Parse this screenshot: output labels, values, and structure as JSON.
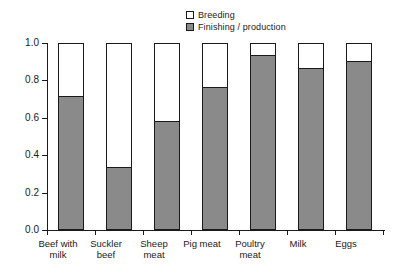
{
  "chart_data": {
    "type": "bar",
    "subtype": "stacked-bar-100percent",
    "title": "",
    "xlabel": "",
    "ylabel": "",
    "ylim": [
      0.0,
      1.0
    ],
    "grid": false,
    "legend_position": "top-center",
    "categories": [
      "Beef with milk",
      "Suckler beef",
      "Sheep meat",
      "Pig meat",
      "Poultry meat",
      "Milk",
      "Eggs"
    ],
    "category_labels_wrapped": [
      "Beef with\nmilk",
      "Suckler\nbeef",
      "Sheep\nmeat",
      "Pig meat",
      "Poultry\nmeat",
      "Milk",
      "Eggs"
    ],
    "ytick_labels": [
      "1.0",
      "0.8",
      "0.6",
      "0.4",
      "0.2",
      "0.0"
    ],
    "ytick_values": [
      1.0,
      0.8,
      0.6,
      0.4,
      0.2,
      0.0
    ],
    "series": [
      {
        "name": "Finishing / production",
        "color": "#8a8a8a",
        "values": [
          0.71,
          0.33,
          0.58,
          0.76,
          0.93,
          0.86,
          0.9
        ]
      },
      {
        "name": "Breeding",
        "color": "#ffffff",
        "values": [
          0.29,
          0.67,
          0.42,
          0.24,
          0.07,
          0.14,
          0.1
        ]
      }
    ],
    "legend": [
      {
        "label": "Breeding",
        "swatch": "white-square",
        "color": "#ffffff"
      },
      {
        "label": "Finishing / production",
        "swatch": "gray-square",
        "color": "#8a8a8a"
      }
    ]
  },
  "colors": {
    "axis": "#1a1a1a",
    "finishing_fill": "#8a8a8a",
    "breeding_fill": "#ffffff",
    "background": "#ffffff"
  }
}
